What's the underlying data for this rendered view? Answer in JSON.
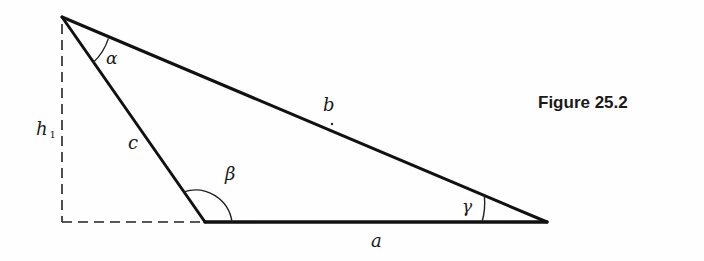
{
  "figure": {
    "title": "Figure 25.2"
  },
  "triangle": {
    "sides": {
      "a": "a",
      "b": "b",
      "c": "c"
    },
    "angles": {
      "alpha": "α",
      "beta": "β",
      "gamma": "γ"
    },
    "height": {
      "symbol": "h",
      "subscript": "1"
    }
  },
  "colors": {
    "stroke": "#111111",
    "background": "#fefefe"
  }
}
